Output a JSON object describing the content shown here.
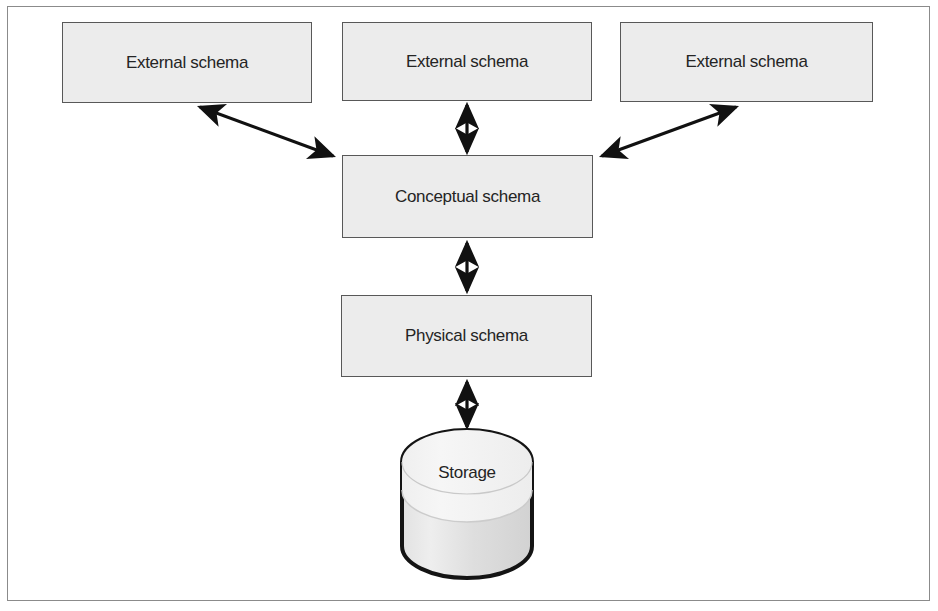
{
  "diagram": {
    "frame": {
      "border_color": "#8b8b8b"
    },
    "style": {
      "box_fill": "#ececec",
      "box_border": "#585858",
      "text_color": "#242424",
      "arrow_color": "#111111",
      "cylinder_top_fill": "#f2f2f2",
      "cylinder_body_fill": "#dcdcdc",
      "cylinder_outline": "#141414"
    },
    "nodes": [
      {
        "id": "external-schema-1",
        "label": "External schema",
        "shape": "rectangle",
        "x": 62,
        "y": 22,
        "w": 250,
        "h": 81
      },
      {
        "id": "external-schema-2",
        "label": "External schema",
        "shape": "rectangle",
        "x": 342,
        "y": 22,
        "w": 250,
        "h": 79
      },
      {
        "id": "external-schema-3",
        "label": "External schema",
        "shape": "rectangle",
        "x": 620,
        "y": 22,
        "w": 253,
        "h": 80
      },
      {
        "id": "conceptual-schema",
        "label": "Conceptual schema",
        "shape": "rectangle",
        "x": 342,
        "y": 155,
        "w": 251,
        "h": 83
      },
      {
        "id": "physical-schema",
        "label": "Physical schema",
        "shape": "rectangle",
        "x": 341,
        "y": 295,
        "w": 251,
        "h": 82
      },
      {
        "id": "storage",
        "label": "Storage",
        "shape": "cylinder",
        "x": 402,
        "y": 430,
        "w": 130,
        "h": 148
      }
    ],
    "connections": [
      {
        "id": "link-external1-conceptual",
        "from": "external-schema-1",
        "to": "conceptual-schema",
        "kind": "double-arrow",
        "orientation": "diagonal"
      },
      {
        "id": "link-external2-conceptual",
        "from": "external-schema-2",
        "to": "conceptual-schema",
        "kind": "double-arrow",
        "orientation": "vertical"
      },
      {
        "id": "link-external3-conceptual",
        "from": "external-schema-3",
        "to": "conceptual-schema",
        "kind": "double-arrow",
        "orientation": "diagonal"
      },
      {
        "id": "link-conceptual-physical",
        "from": "conceptual-schema",
        "to": "physical-schema",
        "kind": "double-arrow",
        "orientation": "vertical"
      },
      {
        "id": "link-physical-storage",
        "from": "physical-schema",
        "to": "storage",
        "kind": "double-arrow",
        "orientation": "vertical"
      }
    ]
  }
}
